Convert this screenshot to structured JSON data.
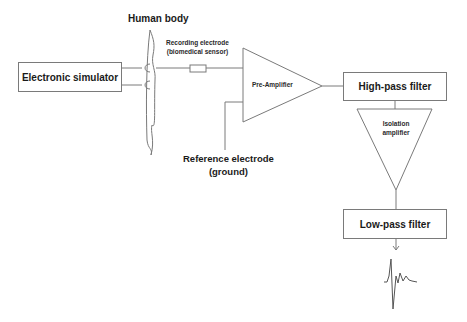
{
  "diagram": {
    "type": "block-diagram",
    "title": "",
    "nodes": [
      {
        "id": "simulator",
        "label": "Electronic simulator",
        "shape": "rectangle"
      },
      {
        "id": "body",
        "label": "Human body",
        "shape": "outline"
      },
      {
        "id": "electrode",
        "label_line1": "Recording electrode",
        "label_line2": "(biomedical sensor)",
        "shape": "resistor"
      },
      {
        "id": "preamp",
        "label": "Pre-Amplifier",
        "shape": "triangle-right"
      },
      {
        "id": "reference",
        "label_line1": "Reference electrode",
        "label_line2": "(ground)",
        "shape": "line"
      },
      {
        "id": "hpf",
        "label": "High-pass filter",
        "shape": "rectangle"
      },
      {
        "id": "iso",
        "label_line1": "Isolation",
        "label_line2": "amplifier",
        "shape": "triangle-down"
      },
      {
        "id": "lpf",
        "label": "Low-pass filter",
        "shape": "rectangle"
      },
      {
        "id": "output",
        "label": "",
        "shape": "ecg-waveform"
      }
    ],
    "edges": [
      {
        "from": "simulator",
        "to": "body"
      },
      {
        "from": "body",
        "to": "electrode"
      },
      {
        "from": "electrode",
        "to": "preamp"
      },
      {
        "from": "reference",
        "to": "preamp"
      },
      {
        "from": "preamp",
        "to": "hpf"
      },
      {
        "from": "hpf",
        "to": "iso"
      },
      {
        "from": "iso",
        "to": "lpf"
      },
      {
        "from": "lpf",
        "to": "output"
      }
    ]
  },
  "colors": {
    "line": "#7a7a7a",
    "text": "#1a1a1a"
  }
}
